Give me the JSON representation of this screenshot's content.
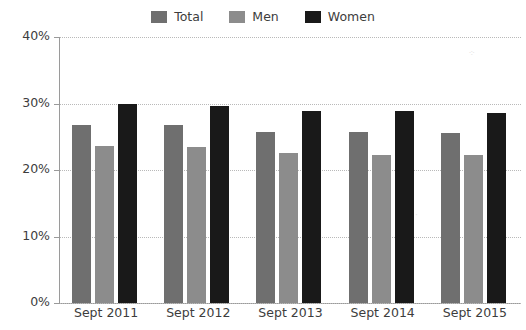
{
  "chart_data": {
    "type": "bar",
    "title": "",
    "xlabel": "",
    "ylabel": "",
    "categories": [
      "Sept 2011",
      "Sept 2012",
      "Sept 2013",
      "Sept 2014",
      "Sept 2015"
    ],
    "series": [
      {
        "name": "Total",
        "color": "#6f6f6f",
        "values": [
          26.8,
          26.7,
          25.7,
          25.7,
          25.6
        ]
      },
      {
        "name": "Men",
        "color": "#8c8c8c",
        "values": [
          23.6,
          23.4,
          22.5,
          22.3,
          22.3
        ]
      },
      {
        "name": "Women",
        "color": "#191919",
        "values": [
          30.0,
          29.7,
          28.8,
          28.8,
          28.5
        ]
      }
    ],
    "ylim": [
      0,
      40
    ],
    "yticks": [
      0,
      10,
      20,
      30,
      40
    ],
    "ytick_labels": [
      "0%",
      "10%",
      "20%",
      "30%",
      "40%"
    ],
    "grid": true,
    "legend_position": "top-center",
    "value_suffix": "%"
  }
}
